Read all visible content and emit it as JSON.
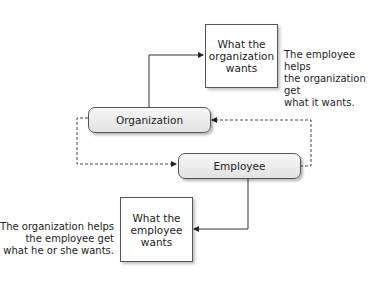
{
  "diagram": {
    "nodes": {
      "org_wants": {
        "label_lines": [
          "What the",
          "organization",
          "wants"
        ]
      },
      "organization": {
        "label": "Organization"
      },
      "employee": {
        "label": "Employee"
      },
      "emp_wants": {
        "label_lines": [
          "What the",
          "employee",
          "wants"
        ]
      }
    },
    "notes": {
      "top": [
        "The employee helps",
        "the organization get",
        "what it wants."
      ],
      "bottom": [
        "The organization helps",
        "the employee get",
        "what he or she wants."
      ]
    },
    "edges": [
      {
        "from": "organization",
        "to": "org_wants",
        "style": "solid"
      },
      {
        "from": "employee",
        "to": "emp_wants",
        "style": "solid"
      },
      {
        "from": "organization",
        "to": "employee",
        "style": "dashed"
      },
      {
        "from": "employee",
        "to": "organization",
        "style": "dashed"
      }
    ]
  }
}
